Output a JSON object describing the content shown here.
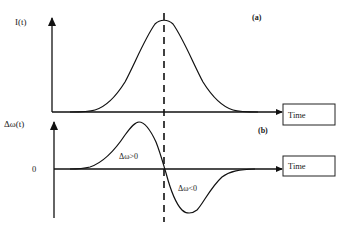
{
  "panels": {
    "a": {
      "tag": "(a)",
      "y_label": "I(t)",
      "x_label": "Time",
      "curve": "Gaussian pulse intensity"
    },
    "b": {
      "tag": "(b)",
      "y_label": "Δω(t)",
      "zero_label": "0",
      "x_label": "Time",
      "positive_region_label": "Δω>0",
      "negative_region_label": "Δω<0",
      "curve": "Frequency shift (derivative of pulse)"
    }
  },
  "colors": {
    "line": "#111111",
    "background": "#ffffff"
  }
}
